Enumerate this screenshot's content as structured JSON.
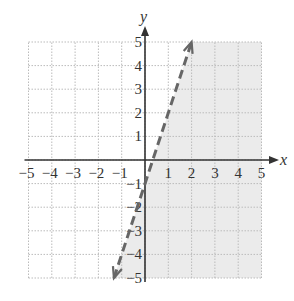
{
  "chart_data": {
    "type": "line",
    "title": "",
    "xlabel": "x",
    "ylabel": "y",
    "xlim": [
      -5,
      5
    ],
    "ylim": [
      -5,
      5
    ],
    "grid": true,
    "x_ticks": [
      "-5",
      "-4",
      "-3",
      "-2",
      "-1",
      "1",
      "2",
      "3",
      "4",
      "5"
    ],
    "y_ticks": [
      "5",
      "4",
      "3",
      "2",
      "1",
      "-1",
      "-2",
      "-3",
      "-4",
      "-5"
    ],
    "series": [
      {
        "name": "boundary line y = 3x - 1",
        "style": "dashed",
        "arrows": "both",
        "x": [
          -1.333,
          2
        ],
        "y": [
          -5,
          5
        ]
      }
    ],
    "shaded_region": {
      "inequality": "y < 3x - 1",
      "side": "right/below the dashed line",
      "color": "#ebebeb"
    },
    "colors": {
      "axis": "#333333",
      "grid": "#bbbbbb",
      "line": "#666666",
      "shade": "#ebebeb"
    }
  }
}
